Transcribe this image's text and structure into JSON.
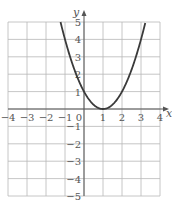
{
  "chart_data": {
    "type": "line",
    "title": "",
    "xlabel": "x",
    "ylabel": "y",
    "xlim": [
      -4,
      4
    ],
    "ylim": [
      -5,
      5
    ],
    "grid": true,
    "x_ticks": [
      -4,
      -3,
      -2,
      -1,
      0,
      1,
      2,
      3,
      4
    ],
    "x_tick_labels": [
      "−4",
      "−3",
      "−2",
      "−1",
      "0",
      "1",
      "2",
      "3",
      "4"
    ],
    "y_ticks": [
      -5,
      -4,
      -3,
      -2,
      -1,
      1,
      2,
      3,
      4,
      5
    ],
    "y_tick_labels": [
      "−5",
      "−4",
      "−3",
      "−2",
      "−1",
      "1",
      "2",
      "3",
      "4",
      "5"
    ],
    "series": [
      {
        "name": "y = (x − 1)²",
        "color": "#3a3a3a",
        "x": [
          -1.236,
          -1,
          -0.5,
          0,
          0.5,
          1,
          1.5,
          2,
          2.5,
          3,
          3.236
        ],
        "y": [
          5,
          4,
          2.25,
          1,
          0.25,
          0,
          0.25,
          1,
          2.25,
          4,
          5
        ]
      }
    ],
    "colors": {
      "grid": "#b8b8b8",
      "axis": "#555555",
      "curve": "#3a3a3a",
      "text": "#555555"
    }
  }
}
